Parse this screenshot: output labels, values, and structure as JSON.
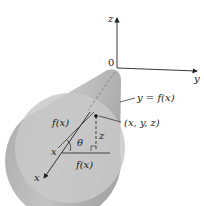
{
  "figure": {
    "axes": {
      "z_label": "z",
      "y_label": "y",
      "x_label": "x",
      "origin_label": "0"
    },
    "curve_label": "y = f(x)",
    "point_label": "(x, y, z)",
    "radius_label_top": "f(x)",
    "radius_label_bottom": "f(x)",
    "height_label": "z",
    "angle_label": "θ",
    "center_label": "x",
    "colors": {
      "surface": "#b9b9b9",
      "disk": "#c6c6c6",
      "line": "#222222"
    }
  }
}
